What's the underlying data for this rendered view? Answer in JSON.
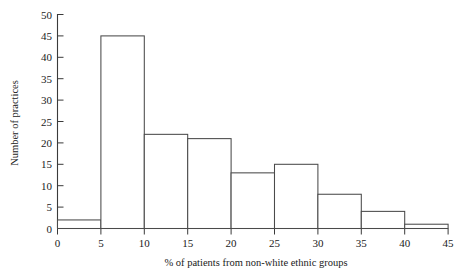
{
  "chart_data": {
    "type": "bar",
    "title": "",
    "subtitle": "",
    "xlabel": "% of patients from non-white ethnic groups",
    "ylabel": "Number of practices",
    "categories": [
      "0-5",
      "5-10",
      "10-15",
      "15-20",
      "20-25",
      "25-30",
      "30-35",
      "35-40",
      "40-45"
    ],
    "bin_edges": [
      0,
      5,
      10,
      15,
      20,
      25,
      30,
      35,
      40,
      45
    ],
    "values": [
      2,
      45,
      22,
      21,
      13,
      15,
      8,
      4,
      1
    ],
    "xlim": [
      0,
      45
    ],
    "ylim": [
      0,
      50
    ],
    "xticks": [
      "0",
      "5",
      "10",
      "15",
      "20",
      "25",
      "30",
      "35",
      "40",
      "45"
    ],
    "xtick_values": [
      0,
      5,
      10,
      15,
      20,
      25,
      30,
      35,
      40,
      45
    ],
    "yticks": [
      "0",
      "5",
      "10",
      "15",
      "20",
      "25",
      "30",
      "35",
      "40",
      "45",
      "50"
    ],
    "ytick_values": [
      0,
      5,
      10,
      15,
      20,
      25,
      30,
      35,
      40,
      45,
      50
    ],
    "grid": false,
    "legend": null,
    "bar_fill_color": "#ffffff",
    "bar_edge_color": "#4a4a4a",
    "axis_color": "#3a3a3a",
    "background_color": "#ffffff",
    "bar_gap_between_first_and_second": false
  },
  "figure": {
    "name": "histogram-percent-nonwhite-patients",
    "x_axis_label": "% of patients from non-white ethnic groups",
    "y_axis_label": "Number of practices"
  }
}
